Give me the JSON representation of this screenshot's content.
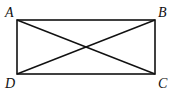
{
  "diagram": {
    "type": "rectangle-with-diagonals",
    "vertices": [
      {
        "name": "A",
        "x": 17,
        "y": 20,
        "label_x": 5,
        "label_y": 17
      },
      {
        "name": "B",
        "x": 155,
        "y": 20,
        "label_x": 158,
        "label_y": 17
      },
      {
        "name": "C",
        "x": 155,
        "y": 74,
        "label_x": 158,
        "label_y": 88
      },
      {
        "name": "D",
        "x": 17,
        "y": 74,
        "label_x": 5,
        "label_y": 88
      }
    ],
    "labels": {
      "A": "A",
      "B": "B",
      "C": "C",
      "D": "D"
    },
    "stroke_color": "#111111"
  }
}
